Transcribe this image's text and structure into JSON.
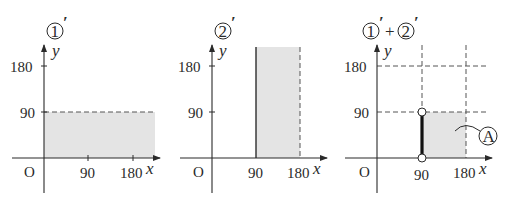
{
  "panels": [
    {
      "title": "①′",
      "circled_number": "1",
      "prime": "′",
      "x_label": "x",
      "y_label": "y",
      "origin": "O",
      "x_ticks": [
        "90",
        "180"
      ],
      "y_ticks": [
        "90",
        "180"
      ],
      "region": "0 ≤ x, 0 ≤ y < 90 (shaded horizontal band, dashed boundary y=90)"
    },
    {
      "title": "②′",
      "circled_number": "2",
      "prime": "′",
      "x_label": "x",
      "y_label": "y",
      "origin": "O",
      "x_ticks": [
        "90",
        "180"
      ],
      "y_ticks": [
        "90",
        "180"
      ],
      "region": "90 ≤ x < 180 (shaded vertical band, solid x=90, dashed x=180)"
    },
    {
      "title": "①′+②′",
      "circled_a": "1",
      "circled_b": "2",
      "prime": "′",
      "plus": "+",
      "x_label": "x",
      "y_label": "y",
      "origin": "O",
      "x_ticks": [
        "90",
        "180"
      ],
      "y_ticks": [
        "90",
        "180"
      ],
      "region_label": "A",
      "region": "90 ≤ x < 180, 0 < y < 90 with bold segment on x=90 between open endpoints"
    }
  ],
  "colors": {
    "shade": "#e4e4e4",
    "ink": "#2a2a2a",
    "background": "#ffffff"
  }
}
